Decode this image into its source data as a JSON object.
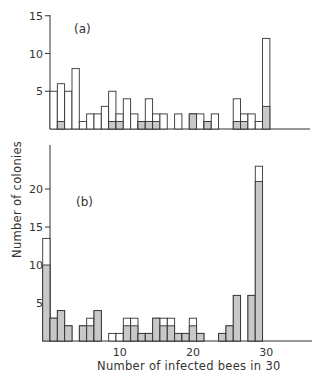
{
  "chart_data": [
    {
      "type": "bar",
      "panel": "(a)",
      "title": "",
      "xlabel": "Number of infected bees in 30",
      "ylabel": "Number of colonies",
      "ylim": [
        0,
        15
      ],
      "yticks": [
        5,
        10,
        15
      ],
      "xticks": [
        10,
        20,
        30
      ],
      "x": [
        1,
        2,
        3,
        4,
        5,
        6,
        7,
        8,
        9,
        10,
        11,
        12,
        13,
        14,
        15,
        16,
        17,
        18,
        19,
        20,
        21,
        22,
        23,
        24,
        25,
        26,
        27,
        28,
        29,
        30
      ],
      "series": [
        {
          "name": "total (open)",
          "values": [
            5,
            6,
            5,
            8,
            1,
            2,
            2,
            3,
            5,
            2,
            4,
            2,
            1,
            4,
            2,
            2,
            0,
            2,
            0,
            2,
            2,
            1,
            2,
            0,
            0,
            4,
            2,
            2,
            1,
            12
          ]
        },
        {
          "name": "shaded",
          "values": [
            0,
            1,
            0,
            0,
            0,
            0,
            0,
            0,
            1,
            1,
            0,
            0,
            1,
            1,
            1,
            0,
            0,
            0,
            0,
            2,
            0,
            1,
            0,
            0,
            0,
            1,
            1,
            0,
            0,
            3
          ]
        }
      ]
    },
    {
      "type": "bar",
      "panel": "(b)",
      "title": "",
      "xlabel": "Number of infected bees in 30",
      "ylabel": "Number of colonies",
      "ylim": [
        0,
        24
      ],
      "yticks": [
        5,
        10,
        15,
        20
      ],
      "xticks": [
        10,
        20,
        30
      ],
      "x": [
        0,
        1,
        2,
        3,
        4,
        5,
        6,
        7,
        8,
        9,
        10,
        11,
        12,
        13,
        14,
        15,
        16,
        17,
        18,
        19,
        20,
        21,
        22,
        23,
        24,
        25,
        26,
        27,
        28,
        29,
        30
      ],
      "series": [
        {
          "name": "total (open)",
          "values": [
            13.5,
            3,
            4,
            2,
            0,
            2,
            3,
            4,
            0,
            1,
            1,
            3,
            3,
            1,
            1,
            3,
            3,
            3,
            1,
            1,
            3,
            1,
            0,
            0,
            1,
            2,
            6,
            0,
            6,
            23
          ]
        },
        {
          "name": "shaded",
          "values": [
            10,
            3,
            4,
            2,
            0,
            2,
            2,
            4,
            0,
            0,
            0,
            2,
            2,
            1,
            1,
            3,
            2,
            2,
            1,
            1,
            2,
            1,
            0,
            0,
            1,
            2,
            6,
            0,
            6,
            21
          ]
        }
      ]
    }
  ],
  "labels": {
    "panel_a": "(a)",
    "panel_b": "(b)",
    "ylabel": "Number of colonies",
    "xlabel": "Number of infected bees in 30",
    "a_yticks": [
      "5",
      "10",
      "15"
    ],
    "b_yticks": [
      "5",
      "10",
      "15",
      "20"
    ],
    "xticks": [
      "10",
      "20",
      "30"
    ]
  },
  "colors": {
    "bar_fill_open": "#ffffff",
    "bar_fill_shaded": "#c8c8c8",
    "stroke": "#333333"
  }
}
